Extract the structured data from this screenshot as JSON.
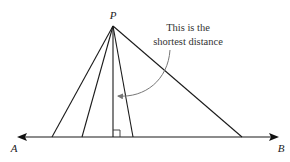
{
  "figure": {
    "type": "geometry-diagram",
    "point": {
      "label": "P",
      "x": 113,
      "y": 26
    },
    "line": {
      "start_label": "A",
      "end_label": "B",
      "y": 137,
      "x_start": 18,
      "x_end": 277
    },
    "segments_from_P_to_line_x": [
      52,
      82,
      113,
      133,
      242
    ],
    "perpendicular_foot_x": 113,
    "right_angle_marker": true,
    "annotation": {
      "line1": "This is the",
      "line2": "shortest distance",
      "points_to": "perpendicular segment"
    },
    "colors": {
      "lines": "#1a1a1a",
      "annotation_arrow": "#777777",
      "text": "#222222"
    }
  }
}
